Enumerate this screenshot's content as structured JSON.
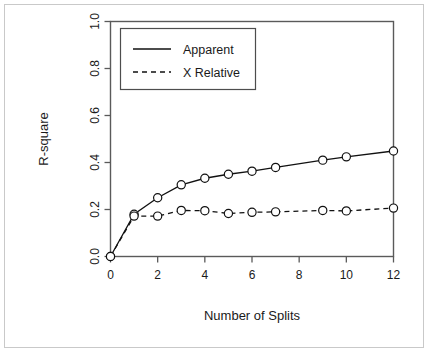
{
  "chart_data": {
    "type": "line",
    "title": "",
    "xlabel": "Number of Splits",
    "ylabel": "R-square",
    "x": [
      0,
      1,
      2,
      3,
      4,
      5,
      6,
      7,
      9,
      10,
      12
    ],
    "xlim": [
      0,
      12
    ],
    "ylim": [
      0.0,
      1.0
    ],
    "grid": false,
    "legend_position": "top-left",
    "xticks": [
      "0",
      "2",
      "4",
      "6",
      "8",
      "10",
      "12"
    ],
    "xtick_values": [
      0,
      2,
      4,
      6,
      8,
      10,
      12
    ],
    "yticks": [
      "0.0",
      "0.2",
      "0.4",
      "0.6",
      "0.8",
      "1.0"
    ],
    "ytick_values": [
      0.0,
      0.2,
      0.4,
      0.6,
      0.8,
      1.0
    ],
    "series": [
      {
        "name": "Apparent",
        "style": "solid",
        "marker": "circle",
        "values": [
          0.0,
          0.18,
          0.25,
          0.305,
          0.333,
          0.35,
          0.363,
          0.379,
          0.41,
          0.424,
          0.449
        ]
      },
      {
        "name": "X Relative",
        "style": "dashed",
        "marker": "circle",
        "values": [
          0.0,
          0.172,
          0.172,
          0.196,
          0.195,
          0.183,
          0.188,
          0.19,
          0.196,
          0.194,
          0.206
        ]
      }
    ]
  },
  "legend": {
    "entries": [
      {
        "label": "Apparent",
        "style": "solid"
      },
      {
        "label": "X Relative",
        "style": "dashed"
      }
    ]
  }
}
